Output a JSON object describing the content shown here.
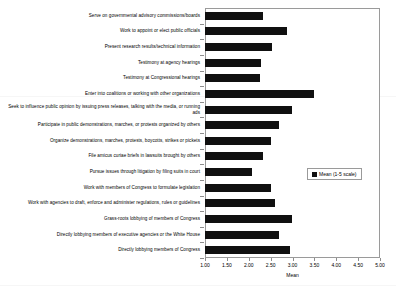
{
  "chart_data": {
    "type": "bar",
    "orientation": "horizontal",
    "title": "",
    "xlabel": "Mean",
    "ylabel": "",
    "xlim": [
      1.0,
      5.0
    ],
    "xticks": [
      "1.00",
      "1.50",
      "2.00",
      "2.50",
      "3.00",
      "3.50",
      "4.00",
      "4.50",
      "5.00"
    ],
    "xtick_values": [
      1.0,
      1.5,
      2.0,
      2.5,
      3.0,
      3.5,
      4.0,
      4.5,
      5.0
    ],
    "grid": false,
    "legend": {
      "position": "middle-right-inside",
      "entries": [
        {
          "name": "Mean (1-5 scale)",
          "color": "#101010"
        }
      ]
    },
    "series": [
      {
        "name": "Mean (1-5 scale)",
        "color": "#101010",
        "values": [
          2.32,
          2.87,
          2.53,
          2.27,
          2.26,
          3.49,
          2.99,
          2.69,
          2.51,
          2.33,
          2.07,
          2.51,
          2.6,
          2.99,
          2.69,
          2.94
        ]
      }
    ],
    "categories": [
      "Serve on governmental advisory commissions/boards",
      "Work to appoint or elect public officials",
      "Present research results/technical information",
      "Testimony at agency hearings",
      "Testimony at Congressional hearings",
      "Enter into coalitions or working with other organizations",
      "Seek to influence public opinion by issuing press releases, talking with the media, or running ads",
      "Participate in public demonstrations, marches, or protests organized by others",
      "Organize demonstrations, marches,  protests, boycotts, strikes or pickets",
      "File amicus curiae briefs in lawsuits brought by others",
      "Pursue issues through litigation by filing suits in court",
      "Work with members of Congress to formulate legislation",
      "Work with agencies to draft, enforce and administer regulations, rules or guidelines",
      "Grass-roots lobbying of members of Congress",
      "Directly lobbying members of executive agencies or the White House",
      "Directly lobbying members of Congress"
    ]
  }
}
